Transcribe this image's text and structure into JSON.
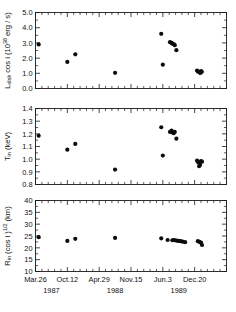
{
  "figure": {
    "title": "",
    "panel_count": 3,
    "background_color": "#ffffff",
    "marker_color": "#0d0d0d",
    "axis_color": "#1a1a1a"
  },
  "xaxis": {
    "label": "",
    "tick_labels": [
      "Mar.26",
      "Oct.12",
      "Apr.29",
      "Nov.15",
      "Jun.3",
      "Dec.20"
    ],
    "year_labels": [
      "1987",
      "1988",
      "1989"
    ],
    "range": [
      0,
      1200
    ],
    "tick_values": [
      0,
      200,
      400,
      600,
      800,
      1000
    ],
    "year_positions": [
      100,
      500,
      900
    ],
    "minor_ticks_per_interval": 4
  },
  "chart_data": [
    {
      "type": "scatter",
      "panel": "top",
      "title": "",
      "xlabel": "",
      "ylabel": "L_disk cos i (10^38 erg / s)",
      "ylabel_parts": {
        "base1": "L",
        "sub1": "disk",
        "base2": "cos i (10",
        "sup": "38",
        "base3": "erg / s)"
      },
      "ylim": [
        0.0,
        5.0
      ],
      "ytick_labels": [
        "0.0",
        "1.0",
        "2.0",
        "3.0",
        "4.0",
        "5.0"
      ],
      "ytick_values": [
        0.0,
        1.0,
        2.0,
        3.0,
        4.0,
        5.0
      ],
      "grid": false,
      "legend": null,
      "x": [
        20,
        200,
        250,
        500,
        790,
        845,
        855,
        860,
        868,
        875,
        885,
        800,
        1015,
        1020,
        1028,
        1032,
        1036,
        1040,
        1045
      ],
      "y": [
        2.9,
        1.75,
        2.25,
        1.03,
        3.6,
        3.05,
        3.0,
        2.95,
        2.92,
        2.85,
        2.52,
        1.57,
        1.18,
        1.12,
        1.08,
        1.05,
        1.02,
        1.15,
        1.1
      ]
    },
    {
      "type": "scatter",
      "panel": "middle",
      "title": "",
      "xlabel": "",
      "ylabel": "T_in (keV)",
      "ylabel_parts": {
        "base1": "T",
        "sub1": "in",
        "base2": "(keV)"
      },
      "ylim": [
        0.8,
        1.4
      ],
      "ytick_labels": [
        "0.8",
        "0.9",
        "1.0",
        "1.1",
        "1.2",
        "1.3",
        "1.4"
      ],
      "ytick_values": [
        0.8,
        0.9,
        1.0,
        1.1,
        1.2,
        1.3,
        1.4
      ],
      "grid": false,
      "legend": null,
      "x": [
        20,
        200,
        250,
        500,
        790,
        845,
        855,
        862,
        868,
        875,
        885,
        800,
        1015,
        1022,
        1028,
        1034,
        1040,
        1046
      ],
      "y": [
        1.185,
        1.075,
        1.12,
        0.918,
        1.252,
        1.215,
        1.225,
        1.21,
        1.205,
        1.215,
        1.162,
        1.028,
        0.988,
        0.975,
        0.945,
        0.955,
        0.985,
        0.98
      ]
    },
    {
      "type": "scatter",
      "panel": "bottom",
      "title": "",
      "xlabel": "",
      "ylabel": "R_in (cos i)^1/2 (km)",
      "ylabel_parts": {
        "base1": "R",
        "sub1": "in",
        "base2": "(cos i )",
        "sup": "1/2",
        "base3": "(km)"
      },
      "ylim": [
        10,
        40
      ],
      "ytick_labels": [
        "10",
        "15",
        "20",
        "25",
        "30",
        "35",
        "40"
      ],
      "ytick_values": [
        10,
        15,
        20,
        25,
        30,
        35,
        40
      ],
      "grid": false,
      "legend": null,
      "x": [
        20,
        200,
        250,
        500,
        790,
        830,
        860,
        868,
        876,
        884,
        892,
        900,
        912,
        925,
        940,
        1020,
        1030,
        1040,
        1046
      ],
      "y": [
        24.5,
        22.9,
        23.8,
        24.2,
        24.0,
        23.3,
        23.2,
        23.3,
        23.2,
        23.1,
        23.0,
        22.9,
        22.8,
        22.6,
        22.4,
        22.8,
        22.5,
        22.2,
        21.2
      ]
    }
  ]
}
